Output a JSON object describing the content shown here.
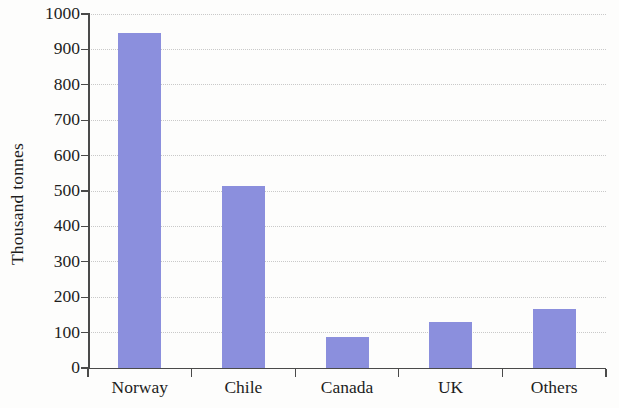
{
  "chart_data": {
    "type": "bar",
    "title": "",
    "xlabel": "",
    "ylabel": "Thousand tonnes",
    "categories": [
      "Norway",
      "Chile",
      "Canada",
      "UK",
      "Others"
    ],
    "values": [
      945,
      515,
      88,
      130,
      168
    ],
    "ylim": [
      0,
      1000
    ],
    "ytick_labels": [
      "0",
      "100",
      "200",
      "300",
      "400",
      "500",
      "600",
      "700",
      "800",
      "900",
      "1000"
    ],
    "ytick_values": [
      0,
      100,
      200,
      300,
      400,
      500,
      600,
      700,
      800,
      900,
      1000
    ],
    "grid": "horizontal dotted",
    "legend": "none",
    "bar_color": "#8b8fdd",
    "axis_color": "#4a4a4a",
    "grid_color": "#c9c9c9",
    "background_color": "#fdfdfc"
  }
}
